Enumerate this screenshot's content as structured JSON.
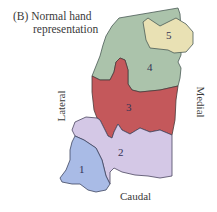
{
  "figure": {
    "panel_label": "(B)",
    "title_line1": "Normal hand",
    "title_line2": "representation"
  },
  "orientation": {
    "lateral": "Lateral",
    "medial": "Medial",
    "caudal": "Caudal"
  },
  "regions": [
    {
      "id": "1",
      "label": "1",
      "color": "#a9bbe6"
    },
    {
      "id": "2",
      "label": "2",
      "color": "#d4c8e6"
    },
    {
      "id": "3",
      "label": "3",
      "color": "#c4585b"
    },
    {
      "id": "4",
      "label": "4",
      "color": "#abc3ab"
    },
    {
      "id": "5",
      "label": "5",
      "color": "#e9e1b4"
    }
  ]
}
